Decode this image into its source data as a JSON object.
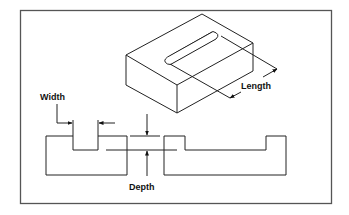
{
  "figure": {
    "type": "engineering-diagram",
    "labels": {
      "width": "Width",
      "length": "Length",
      "depth": "Depth"
    },
    "colors": {
      "frame": "#555555",
      "line": "#222222",
      "background": "#ffffff"
    },
    "views": [
      {
        "name": "isometric-block",
        "description": "rectangular block with rounded slot on top face"
      },
      {
        "name": "section-left",
        "description": "cross-section showing slot width"
      },
      {
        "name": "section-right",
        "description": "cross-section showing slot length"
      }
    ]
  }
}
